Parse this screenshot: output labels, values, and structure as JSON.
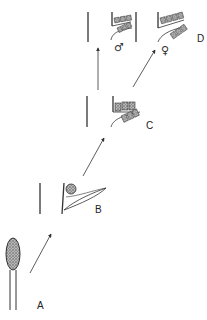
{
  "diagram": {
    "type": "developmental-stages",
    "stages": [
      {
        "id": "A",
        "label": "A",
        "description": "stalk with stippled oval bud"
      },
      {
        "id": "B",
        "label": "B",
        "description": "stem with single leaf and rounded structure"
      },
      {
        "id": "C",
        "label": "C",
        "description": "stem with two rows of stacked structures"
      },
      {
        "id": "D-male",
        "label": "♂",
        "description": "male form with stacked rows"
      },
      {
        "id": "D-female",
        "label": "♀",
        "description": "female form with stacked rows"
      }
    ],
    "group_label": "D",
    "arrows": [
      {
        "from": "A",
        "to": "B"
      },
      {
        "from": "B",
        "to": "C"
      },
      {
        "from": "C",
        "to": "D-male"
      },
      {
        "from": "C",
        "to": "D-female"
      }
    ],
    "colors": {
      "line": "#333333",
      "background": "#ffffff"
    }
  }
}
